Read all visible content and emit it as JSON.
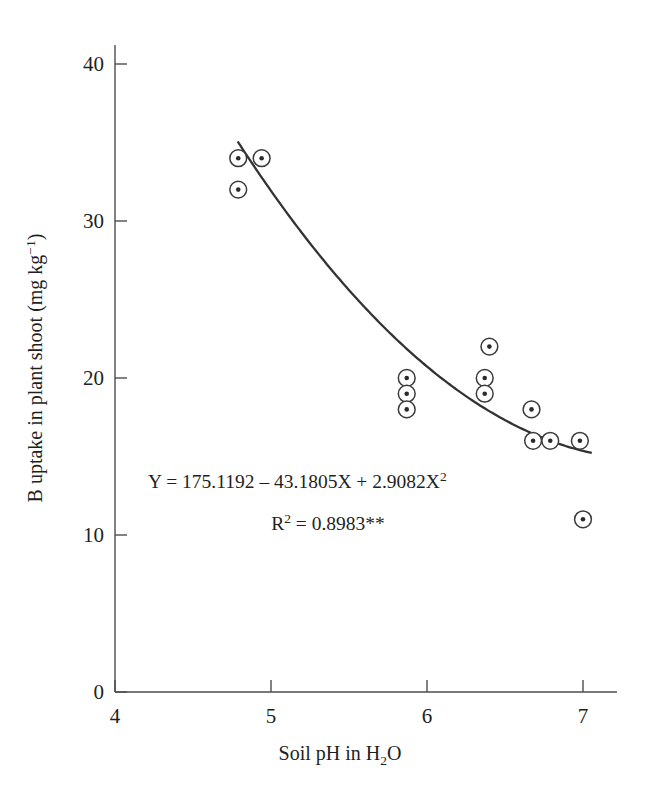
{
  "chart_data": {
    "type": "scatter",
    "title": "",
    "xlabel": "Soil pH in H2O",
    "xlabel_parts": {
      "pre": "Soil pH in H",
      "sub": "2",
      "post": "O"
    },
    "ylabel": "B uptake in plant shoot (mg kg-1)",
    "ylabel_parts": {
      "pre": "B uptake in plant shoot (mg kg",
      "sup": "−1",
      "post": ")"
    },
    "xlim": [
      4,
      7.2
    ],
    "ylim": [
      0,
      42
    ],
    "xticks": [
      4,
      5,
      6,
      7
    ],
    "xtick_labels": [
      "4",
      "5",
      "6",
      "7"
    ],
    "yticks": [
      0,
      10,
      20,
      30,
      40
    ],
    "ytick_labels": [
      "0",
      "10",
      "20",
      "30",
      "40"
    ],
    "grid": false,
    "legend": null,
    "marker_style": "circle-with-center-dot",
    "points": [
      {
        "x": 4.79,
        "y": 34
      },
      {
        "x": 4.94,
        "y": 34
      },
      {
        "x": 4.79,
        "y": 32
      },
      {
        "x": 5.87,
        "y": 20
      },
      {
        "x": 5.87,
        "y": 19
      },
      {
        "x": 5.87,
        "y": 18
      },
      {
        "x": 6.4,
        "y": 22
      },
      {
        "x": 6.37,
        "y": 20
      },
      {
        "x": 6.37,
        "y": 19
      },
      {
        "x": 6.67,
        "y": 18
      },
      {
        "x": 6.68,
        "y": 16
      },
      {
        "x": 6.79,
        "y": 16
      },
      {
        "x": 6.98,
        "y": 16
      },
      {
        "x": 7.0,
        "y": 11
      }
    ],
    "fit_curve": {
      "kind": "quadratic",
      "intercept": 175.1192,
      "b1": -43.1805,
      "b2": 2.9082,
      "x_start": 4.79,
      "x_end": 7.05
    },
    "annotations": {
      "equation": {
        "pre": "Y = 175.1192 – 43.1805X + 2.9082X",
        "sup": "2"
      },
      "r_squared": {
        "symbol": "R",
        "sup": "2",
        "value": " = 0.8983**"
      }
    }
  }
}
